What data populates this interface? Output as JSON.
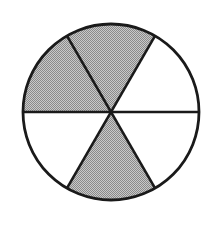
{
  "figure": {
    "kind": "fraction-circle-diagram",
    "title": "Circle divided into six equal sectors with three shaded",
    "background_color": "#ffffff",
    "outline_color": "#1a1a1a",
    "shaded_color": "#ababab",
    "unshaded_color": "#ffffff",
    "center_x": 111,
    "center_y": 112,
    "radius": 88,
    "sector_count": 6,
    "shaded_count": 3,
    "sector_angle_degrees": 60,
    "fraction_label": "3/6",
    "simplified_fraction_label": "1/2"
  },
  "chart_data": {
    "type": "pie",
    "title": "",
    "xlabel": "",
    "ylabel": "",
    "legend_position": "none",
    "grid": false,
    "categories": [
      "sector-1-upper-right",
      "sector-2-upper-left",
      "sector-3-left",
      "sector-4-lower-left",
      "sector-5-lower-right",
      "sector-6-right"
    ],
    "values": [
      60,
      60,
      60,
      60,
      60,
      60
    ],
    "value_unit": "degrees",
    "slices": [
      {
        "name": "sector-1-upper-right",
        "start_angle": 60,
        "end_angle": 120,
        "clock_span": "12 to 2 o'clock",
        "shaded": true,
        "fill": "#ababab"
      },
      {
        "name": "sector-2-upper-left",
        "start_angle": 120,
        "end_angle": 180,
        "clock_span": "10 to 12 o'clock",
        "shaded": true,
        "fill": "#ababab"
      },
      {
        "name": "sector-3-left",
        "start_angle": 180,
        "end_angle": 240,
        "clock_span": "8 to 10 o'clock",
        "shaded": false,
        "fill": "#ffffff"
      },
      {
        "name": "sector-4-lower-left",
        "start_angle": 240,
        "end_angle": 300,
        "clock_span": "6 to 8 o'clock",
        "shaded": true,
        "fill": "#ababab"
      },
      {
        "name": "sector-5-lower-right",
        "start_angle": 300,
        "end_angle": 360,
        "clock_span": "4 to 6 o'clock",
        "shaded": false,
        "fill": "#ffffff"
      },
      {
        "name": "sector-6-right",
        "start_angle": 0,
        "end_angle": 60,
        "clock_span": "2 to 4 o'clock",
        "shaded": false,
        "fill": "#ffffff"
      }
    ],
    "annotations": []
  }
}
